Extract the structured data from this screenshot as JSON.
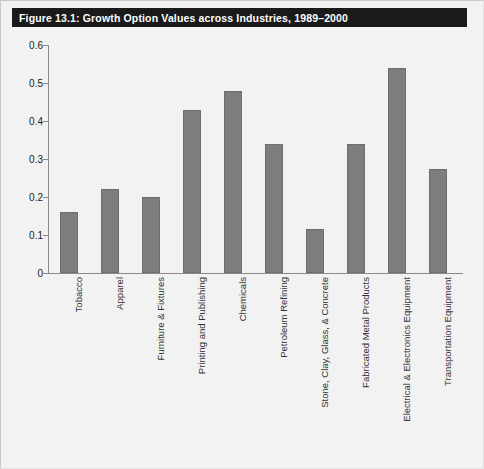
{
  "figure": {
    "title": "Figure 13.1: Growth Option Values across Industries, 1989–2000",
    "bar_color": "#7d7d7d",
    "title_bar_color": "#1a1a1a",
    "background_color": "#f2f2f2",
    "axis_color": "#8a8a8a"
  },
  "chart_data": {
    "type": "bar",
    "title": "Figure 13.1: Growth Option Values across Industries, 1989–2000",
    "xlabel": "",
    "ylabel": "",
    "ylim": [
      0,
      0.6
    ],
    "yticks": [
      "0",
      "0.1",
      "0.2",
      "0.3",
      "0.4",
      "0.5",
      "0.6"
    ],
    "ytick_values": [
      0,
      0.1,
      0.2,
      0.3,
      0.4,
      0.5,
      0.6
    ],
    "grid": false,
    "legend": false,
    "categories": [
      "Tobacco",
      "Apparel",
      "Furniture & Fixtures",
      "Printing and Publishing",
      "Chemicals",
      "Petroleum Refining",
      "Stone, Clay, Glass, & Concrete",
      "Fabricated Metal Products",
      "Electrical & Electronics Equipment",
      "Transportation Equipment"
    ],
    "values": [
      0.16,
      0.22,
      0.2,
      0.43,
      0.48,
      0.34,
      0.115,
      0.34,
      0.54,
      0.275
    ]
  }
}
